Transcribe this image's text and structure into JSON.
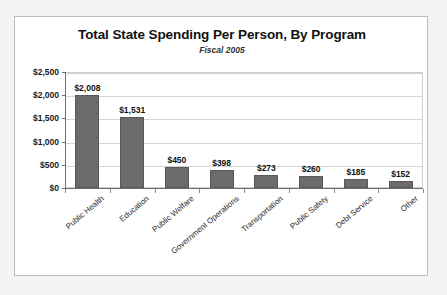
{
  "chart_data": {
    "type": "bar",
    "title": "Total State Spending Per Person, By Program",
    "subtitle": "Fiscal 2005",
    "xlabel": "",
    "ylabel": "",
    "ylim": [
      0,
      2500
    ],
    "ytick_step": 500,
    "grid": true,
    "legend": "none",
    "bar_color": "#6b6b6b",
    "categories": [
      "Public Health",
      "Education",
      "Public Welfare",
      "Government Operations",
      "Transportation",
      "Public Safety",
      "Debt Service",
      "Other"
    ],
    "values": [
      2008,
      1531,
      450,
      398,
      273,
      260,
      185,
      152
    ],
    "value_labels": [
      "$2,008",
      "$1,531",
      "$450",
      "$398",
      "$273",
      "$260",
      "$185",
      "$152"
    ],
    "ytick_labels": [
      "$2,500",
      "$2,000",
      "$1,500",
      "$1,000",
      "$500",
      "$0"
    ],
    "ytick_values": [
      2500,
      2000,
      1500,
      1000,
      500,
      0
    ]
  }
}
